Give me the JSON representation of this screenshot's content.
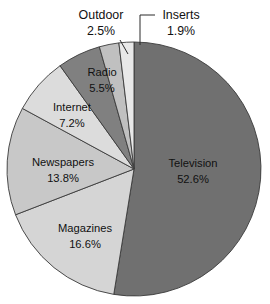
{
  "chart_data": {
    "type": "pie",
    "title": "",
    "subtitle": "",
    "xlabel": "",
    "ylabel": "",
    "legend_position": "none",
    "grid": false,
    "value_unit": "%",
    "start_angle_deg": 0,
    "direction": "clockwise",
    "categories": [
      "Television",
      "Magazines",
      "Newspapers",
      "Internet",
      "Radio",
      "Outdoor",
      "Inserts"
    ],
    "values": [
      52.6,
      16.6,
      13.8,
      7.2,
      5.5,
      2.5,
      1.9
    ],
    "slices": [
      {
        "name": "Television",
        "label": "Television",
        "value": 52.6,
        "value_label": "52.6%",
        "color": "#707070",
        "label_placement": "inside",
        "label_x": 193,
        "label_y": 164,
        "value_x": 193,
        "value_y": 180
      },
      {
        "name": "Magazines",
        "label": "Magazines",
        "value": 16.6,
        "value_label": "16.6%",
        "color": "#d5d5d5",
        "label_placement": "inside",
        "label_x": 85,
        "label_y": 229,
        "value_x": 85,
        "value_y": 245
      },
      {
        "name": "Newspapers",
        "label": "Newspapers",
        "value": 13.8,
        "value_label": "13.8%",
        "color": "#c8c8c8",
        "label_placement": "inside",
        "label_x": 63,
        "label_y": 163,
        "value_x": 63,
        "value_y": 179
      },
      {
        "name": "Internet",
        "label": "Internet",
        "value": 7.2,
        "value_label": "7.2%",
        "color": "#dcdcdc",
        "label_placement": "inside",
        "label_x": 72,
        "label_y": 108,
        "value_x": 72,
        "value_y": 124
      },
      {
        "name": "Radio",
        "label": "Radio",
        "value": 5.5,
        "value_label": "5.5%",
        "color": "#808080",
        "label_placement": "inside",
        "label_x": 102,
        "label_y": 73,
        "value_x": 102,
        "value_y": 89
      },
      {
        "name": "Outdoor",
        "label": "Outdoor",
        "value": 2.5,
        "value_label": "2.5%",
        "color": "#c0c0c0",
        "label_placement": "outside",
        "label_x": 101,
        "label_y": 16,
        "value_x": 101,
        "value_y": 32,
        "leader": "M 120 40 L 128 54"
      },
      {
        "name": "Inserts",
        "label": "Inserts",
        "value": 1.9,
        "value_label": "1.9%",
        "color": "#e8e8e8",
        "label_placement": "outside",
        "label_x": 181,
        "label_y": 16,
        "value_x": 181,
        "value_y": 32,
        "leader": "M 155 15 L 140 15 L 140 45"
      }
    ],
    "geometry": {
      "center_x": 134,
      "center_y": 169,
      "radius": 127
    }
  }
}
